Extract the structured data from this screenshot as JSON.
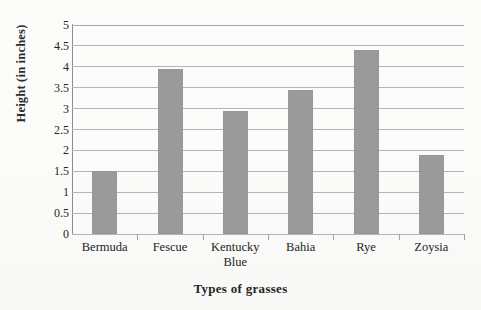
{
  "chart_data": {
    "type": "bar",
    "title": "",
    "xlabel": "Types of grasses",
    "ylabel": "Height (in inches)",
    "categories": [
      "Bermuda",
      "Fescue",
      "Kentucky Blue",
      "Bahia",
      "Rye",
      "Zoysia"
    ],
    "category_lines": [
      [
        "Bermuda"
      ],
      [
        "Fescue"
      ],
      [
        "Kentucky",
        "Blue"
      ],
      [
        "Bahia"
      ],
      [
        "Rye"
      ],
      [
        "Zoysia"
      ]
    ],
    "values": [
      1.5,
      3.95,
      2.95,
      3.45,
      4.4,
      1.9
    ],
    "ylim": [
      0,
      5
    ],
    "ytick_step": 0.5,
    "ytick_labels": [
      "5",
      "4.5",
      "4",
      "3.5",
      "3",
      "2.5",
      "2",
      "1.5",
      "1",
      "0.5",
      "0"
    ],
    "ytick_values": [
      5,
      4.5,
      4,
      3.5,
      3,
      2.5,
      2,
      1.5,
      1,
      0.5,
      0
    ],
    "grid": "horizontal",
    "legend": "none",
    "bar_color": "#9a9a9a",
    "grid_color": "#b4b4b4",
    "axis_color": "#8d8d8d",
    "text_color": "#242424",
    "background_color": "#fdfdfb"
  }
}
